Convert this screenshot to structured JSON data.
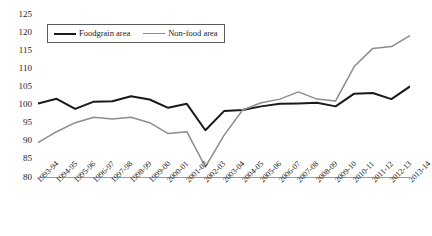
{
  "chart_data": {
    "type": "line",
    "title": "",
    "xlabel": "",
    "ylabel": "",
    "ylim": [
      80,
      125
    ],
    "ytick_step": 5,
    "yticks": [
      125,
      120,
      115,
      110,
      105,
      100,
      95,
      90,
      85,
      80
    ],
    "grid": false,
    "legend_position": "top-left-inside",
    "categories": [
      "1993-94",
      "1994-95",
      "1995-96",
      "1996-97",
      "1997-98",
      "1998-99",
      "1999-00",
      "2000-01",
      "2001-02",
      "2002-03",
      "2003-04",
      "2004-05",
      "2005-06",
      "2006-07",
      "2007-08",
      "2008-09",
      "2009-10",
      "2010-11",
      "2011-12",
      "2012-13",
      "2013-14"
    ],
    "series": [
      {
        "name": "Foodgrain area",
        "color": "#1a1a1a",
        "width": 2,
        "values": [
          100.3,
          101.6,
          98.8,
          100.8,
          100.9,
          102.3,
          101.4,
          99.1,
          100.2,
          92.9,
          98.2,
          98.5,
          99.5,
          100.2,
          100.3,
          100.5,
          99.5,
          103.0,
          103.2,
          101.5,
          105.0
        ]
      },
      {
        "name": "Non-food area",
        "color": "#8c8c8c",
        "width": 1.5,
        "values": [
          89.5,
          92.5,
          95.0,
          96.5,
          96.0,
          96.5,
          95.0,
          92.0,
          92.5,
          82.8,
          91.5,
          98.5,
          100.5,
          101.5,
          103.5,
          101.5,
          101.0,
          110.5,
          115.5,
          116.0,
          119.0
        ]
      }
    ]
  },
  "legend": {
    "items": [
      {
        "label": "Foodgrain area",
        "swatch": "black-line"
      },
      {
        "label": "Non-food area",
        "swatch": "gray-line"
      }
    ]
  },
  "axis": {
    "baseline_value": 80,
    "baseline_color": "#9a9a9a"
  }
}
